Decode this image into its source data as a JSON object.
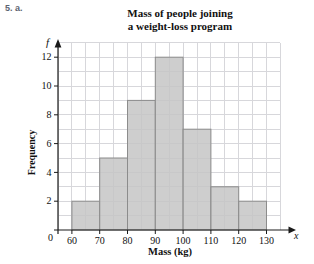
{
  "page": {
    "exercise_label": "5. a."
  },
  "chart": {
    "title_line1": "Mass of people joining",
    "title_line2": "a weight-loss program",
    "ylabel": "Frequency",
    "xlabel": "Mass (kg)",
    "y_axis_symbol": "f",
    "x_axis_symbol": "x"
  },
  "chart_data": {
    "type": "bar",
    "subtype": "histogram",
    "title": "Mass of people joining a weight-loss program",
    "xlabel": "Mass (kg)",
    "ylabel": "Frequency",
    "bin_edges": [
      60,
      70,
      80,
      90,
      100,
      110,
      120,
      130
    ],
    "categories": [
      "60-70",
      "70-80",
      "80-90",
      "90-100",
      "100-110",
      "110-120",
      "120-130"
    ],
    "values": [
      2,
      5,
      9,
      12,
      7,
      3,
      2
    ],
    "x_ticks": [
      60,
      70,
      80,
      90,
      100,
      110,
      120,
      130
    ],
    "y_ticks": [
      2,
      4,
      6,
      8,
      10,
      12
    ],
    "origin_label": "0",
    "xlim": [
      55,
      135
    ],
    "ylim": [
      0,
      13
    ],
    "grid": true,
    "legend": false,
    "colors": {
      "bar_fill": "#c5c5c6",
      "bar_border": "#8c8c8c",
      "grid": "#d7d7db",
      "axis": "#1a1a1a",
      "text": "#111111"
    }
  }
}
